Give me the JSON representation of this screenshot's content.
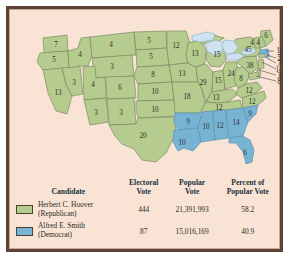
{
  "figure": {
    "colors": {
      "republican_green": "#b5cc8e",
      "democrat_blue": "#77b4d4",
      "lake_blue": "#cfe2ef",
      "map_background": "#f8e3d4",
      "state_border": "#7b8a63",
      "frame": "#5b4338"
    }
  },
  "map": {
    "name": "united-states-electoral-map-1928",
    "lake_label": "Great Lakes",
    "states": [
      {
        "code": "WA",
        "name": "Washington",
        "votes": "7",
        "party": "republican"
      },
      {
        "code": "OR",
        "name": "Oregon",
        "votes": "5",
        "party": "republican"
      },
      {
        "code": "CA",
        "name": "California",
        "votes": "13",
        "party": "republican"
      },
      {
        "code": "NV",
        "name": "Nevada",
        "votes": "3",
        "party": "republican"
      },
      {
        "code": "ID",
        "name": "Idaho",
        "votes": "4",
        "party": "republican"
      },
      {
        "code": "MT",
        "name": "Montana",
        "votes": "4",
        "party": "republican"
      },
      {
        "code": "WY",
        "name": "Wyoming",
        "votes": "3",
        "party": "republican"
      },
      {
        "code": "UT",
        "name": "Utah",
        "votes": "4",
        "party": "republican"
      },
      {
        "code": "AZ",
        "name": "Arizona",
        "votes": "3",
        "party": "republican"
      },
      {
        "code": "CO",
        "name": "Colorado",
        "votes": "6",
        "party": "republican"
      },
      {
        "code": "NM",
        "name": "New Mexico",
        "votes": "3",
        "party": "republican"
      },
      {
        "code": "ND",
        "name": "North Dakota",
        "votes": "5",
        "party": "republican"
      },
      {
        "code": "SD",
        "name": "South Dakota",
        "votes": "5",
        "party": "republican"
      },
      {
        "code": "NE",
        "name": "Nebraska",
        "votes": "8",
        "party": "republican"
      },
      {
        "code": "KS",
        "name": "Kansas",
        "votes": "10",
        "party": "republican"
      },
      {
        "code": "OK",
        "name": "Oklahoma",
        "votes": "10",
        "party": "republican"
      },
      {
        "code": "TX",
        "name": "Texas",
        "votes": "20",
        "party": "republican"
      },
      {
        "code": "MN",
        "name": "Minnesota",
        "votes": "12",
        "party": "republican"
      },
      {
        "code": "IA",
        "name": "Iowa",
        "votes": "13",
        "party": "republican"
      },
      {
        "code": "MO",
        "name": "Missouri",
        "votes": "18",
        "party": "republican"
      },
      {
        "code": "WI",
        "name": "Wisconsin",
        "votes": "13",
        "party": "republican"
      },
      {
        "code": "IL",
        "name": "Illinois",
        "votes": "29",
        "party": "republican"
      },
      {
        "code": "MI",
        "name": "Michigan",
        "votes": "15",
        "party": "republican"
      },
      {
        "code": "IN",
        "name": "Indiana",
        "votes": "15",
        "party": "republican"
      },
      {
        "code": "OH",
        "name": "Ohio",
        "votes": "24",
        "party": "republican"
      },
      {
        "code": "KY",
        "name": "Kentucky",
        "votes": "13",
        "party": "republican"
      },
      {
        "code": "TN",
        "name": "Tennessee",
        "votes": "12",
        "party": "republican"
      },
      {
        "code": "WV",
        "name": "West Virginia",
        "votes": "8",
        "party": "republican"
      },
      {
        "code": "VA",
        "name": "Virginia",
        "votes": "12",
        "party": "republican"
      },
      {
        "code": "NC",
        "name": "North Carolina",
        "votes": "12",
        "party": "republican"
      },
      {
        "code": "PA",
        "name": "Pennsylvania",
        "votes": "38",
        "party": "republican"
      },
      {
        "code": "NY",
        "name": "New York",
        "votes": "45",
        "party": "republican"
      },
      {
        "code": "ME",
        "name": "Maine",
        "votes": "6",
        "party": "republican"
      },
      {
        "code": "NH",
        "name": "New Hampshire",
        "votes": "4",
        "party": "republican"
      },
      {
        "code": "VT",
        "name": "Vermont",
        "votes": "4",
        "party": "republican"
      },
      {
        "code": "MA",
        "name": "Massachusetts",
        "votes": "18",
        "party": "democrat"
      },
      {
        "code": "RI",
        "name": "Rhode Island",
        "votes": "5",
        "party": "democrat"
      },
      {
        "code": "CT",
        "name": "Connecticut",
        "votes": "7",
        "party": "republican"
      },
      {
        "code": "NJ",
        "name": "New Jersey",
        "votes": "14",
        "party": "republican"
      },
      {
        "code": "DE",
        "name": "Delaware",
        "votes": "3",
        "party": "republican"
      },
      {
        "code": "MD",
        "name": "Maryland",
        "votes": "8",
        "party": "republican"
      },
      {
        "code": "AR",
        "name": "Arkansas",
        "votes": "9",
        "party": "democrat"
      },
      {
        "code": "LA",
        "name": "Louisiana",
        "votes": "10",
        "party": "democrat"
      },
      {
        "code": "MS",
        "name": "Mississippi",
        "votes": "10",
        "party": "democrat"
      },
      {
        "code": "AL",
        "name": "Alabama",
        "votes": "12",
        "party": "democrat"
      },
      {
        "code": "GA",
        "name": "Georgia",
        "votes": "14",
        "party": "democrat"
      },
      {
        "code": "SC",
        "name": "South Carolina",
        "votes": "9",
        "party": "democrat"
      },
      {
        "code": "FL",
        "name": "Florida",
        "votes": "6",
        "party": "democrat"
      }
    ]
  },
  "table": {
    "headers": {
      "candidate": "Candidate",
      "electoral_vote_l1": "Electoral",
      "electoral_vote_l2": "Vote",
      "popular_vote_l1": "Popular",
      "popular_vote_l2": "Vote",
      "percent_l1": "Percent of",
      "percent_l2": "Popular Vote"
    },
    "rows": [
      {
        "swatch": "#b5cc8e",
        "name": "Herbert C. Hoover",
        "party": "(Republican)",
        "electoral_vote": "444",
        "popular_vote": "21,391,993",
        "percent": "58.2"
      },
      {
        "swatch": "#77b4d4",
        "name": "Alfred E. Smith",
        "party": "(Democrat)",
        "electoral_vote": "87",
        "popular_vote": "15,016,169",
        "percent": "40.9"
      }
    ]
  }
}
